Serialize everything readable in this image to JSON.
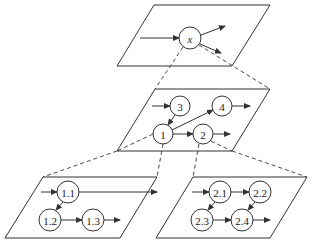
{
  "diagram": {
    "type": "hierarchical-graph-refinement",
    "colors": {
      "stroke": "#333333",
      "background": "#ffffff",
      "text": "#222222"
    },
    "planes": [
      {
        "id": "top",
        "corners": [
          [
            154,
            5
          ],
          [
            270,
            5
          ],
          [
            232,
            66
          ],
          [
            117,
            66
          ]
        ]
      },
      {
        "id": "middle",
        "corners": [
          [
            155,
            89
          ],
          [
            270,
            89
          ],
          [
            232,
            151
          ],
          [
            117,
            151
          ]
        ]
      },
      {
        "id": "bottom-left",
        "corners": [
          [
            43,
            177
          ],
          [
            157,
            177
          ],
          [
            120,
            238
          ],
          [
            5,
            238
          ]
        ]
      },
      {
        "id": "bottom-right",
        "corners": [
          [
            193,
            177
          ],
          [
            307,
            177
          ],
          [
            270,
            238
          ],
          [
            156,
            238
          ]
        ]
      }
    ],
    "nodes": [
      {
        "id": "x",
        "label": "x",
        "plane": "top",
        "cx": 190,
        "cy": 38,
        "r": 11,
        "italic": true
      },
      {
        "id": "n1",
        "label": "1",
        "plane": "middle",
        "cx": 163,
        "cy": 134,
        "r": 10
      },
      {
        "id": "n2",
        "label": "2",
        "plane": "middle",
        "cx": 203,
        "cy": 134,
        "r": 10
      },
      {
        "id": "n3",
        "label": "3",
        "plane": "middle",
        "cx": 180,
        "cy": 106,
        "r": 10
      },
      {
        "id": "n4",
        "label": "4",
        "plane": "middle",
        "cx": 222,
        "cy": 106,
        "r": 10
      },
      {
        "id": "n11",
        "label": "1.1",
        "plane": "bottom-left",
        "cx": 68,
        "cy": 192,
        "r": 11
      },
      {
        "id": "n12",
        "label": "1.2",
        "plane": "bottom-left",
        "cx": 50,
        "cy": 220,
        "r": 11
      },
      {
        "id": "n13",
        "label": "1.3",
        "plane": "bottom-left",
        "cx": 93,
        "cy": 220,
        "r": 11
      },
      {
        "id": "n21",
        "label": "2.1",
        "plane": "bottom-right",
        "cx": 220,
        "cy": 192,
        "r": 11
      },
      {
        "id": "n22",
        "label": "2.2",
        "plane": "bottom-right",
        "cx": 260,
        "cy": 192,
        "r": 11
      },
      {
        "id": "n23",
        "label": "2.3",
        "plane": "bottom-right",
        "cx": 202,
        "cy": 220,
        "r": 11
      },
      {
        "id": "n24",
        "label": "2.4",
        "plane": "bottom-right",
        "cx": 242,
        "cy": 220,
        "r": 11
      }
    ],
    "edges": [
      {
        "from": "in",
        "to": "x",
        "x1": 140,
        "y1": 38,
        "x2": 179,
        "y2": 38
      },
      {
        "from": "x",
        "to": "out",
        "x1": 201,
        "y1": 35,
        "x2": 225,
        "y2": 26
      },
      {
        "from": "x",
        "to": "out",
        "x1": 200,
        "y1": 44,
        "x2": 221,
        "y2": 53
      },
      {
        "from": "in",
        "to": "3",
        "x1": 152,
        "y1": 106,
        "x2": 170,
        "y2": 106
      },
      {
        "from": "3",
        "to": "1",
        "x1": 175,
        "y1": 115,
        "x2": 168,
        "y2": 125
      },
      {
        "from": "1",
        "to": "4",
        "x1": 172,
        "y1": 130,
        "x2": 213,
        "y2": 110
      },
      {
        "from": "4",
        "to": "out",
        "x1": 232,
        "y1": 106,
        "x2": 250,
        "y2": 106
      },
      {
        "from": "1",
        "to": "2",
        "x1": 173,
        "y1": 134,
        "x2": 193,
        "y2": 134
      },
      {
        "from": "2",
        "to": "out",
        "x1": 213,
        "y1": 134,
        "x2": 230,
        "y2": 134
      },
      {
        "from": "in",
        "to": "1.1",
        "x1": 41,
        "y1": 192,
        "x2": 57,
        "y2": 192
      },
      {
        "from": "1.1",
        "to": "out",
        "x1": 79,
        "y1": 192,
        "x2": 157,
        "y2": 192
      },
      {
        "from": "1.1",
        "to": "1.2",
        "x1": 63,
        "y1": 202,
        "x2": 56,
        "y2": 210
      },
      {
        "from": "1.2",
        "to": "1.3",
        "x1": 61,
        "y1": 220,
        "x2": 82,
        "y2": 220
      },
      {
        "from": "1.3",
        "to": "out",
        "x1": 104,
        "y1": 220,
        "x2": 120,
        "y2": 220
      },
      {
        "from": "in",
        "to": "2.1",
        "x1": 192,
        "y1": 192,
        "x2": 209,
        "y2": 192
      },
      {
        "from": "2.1",
        "to": "2.2",
        "x1": 231,
        "y1": 192,
        "x2": 249,
        "y2": 192
      },
      {
        "from": "2.1",
        "to": "2.3",
        "x1": 215,
        "y1": 202,
        "x2": 208,
        "y2": 210
      },
      {
        "from": "2.2",
        "to": "2.4",
        "x1": 255,
        "y1": 202,
        "x2": 248,
        "y2": 210
      },
      {
        "from": "2.3",
        "to": "2.4",
        "x1": 213,
        "y1": 220,
        "x2": 231,
        "y2": 220
      },
      {
        "from": "2.4",
        "to": "out",
        "x1": 253,
        "y1": 220,
        "x2": 270,
        "y2": 220
      }
    ],
    "refinement_links": [
      {
        "from_plane": "top",
        "to_plane": "middle",
        "x1": 183,
        "y1": 47,
        "x2": 155,
        "y2": 89
      },
      {
        "from_plane": "top",
        "to_plane": "middle",
        "x1": 199,
        "y1": 45,
        "x2": 270,
        "y2": 89
      },
      {
        "from_plane": "middle",
        "to_plane": "bottom-left",
        "x1": 153,
        "y1": 134,
        "x2": 117,
        "y2": 151
      },
      {
        "from_plane": "middle",
        "to_plane": "bottom-left",
        "x1": 117,
        "y1": 151,
        "x2": 43,
        "y2": 177
      },
      {
        "from_plane": "middle",
        "to_plane": "bottom-left",
        "x1": 163,
        "y1": 144,
        "x2": 157,
        "y2": 177
      },
      {
        "from_plane": "middle",
        "to_plane": "bottom-right",
        "x1": 199,
        "y1": 144,
        "x2": 193,
        "y2": 177
      },
      {
        "from_plane": "middle",
        "to_plane": "bottom-right",
        "x1": 211,
        "y1": 141,
        "x2": 232,
        "y2": 151
      },
      {
        "from_plane": "middle",
        "to_plane": "bottom-right",
        "x1": 232,
        "y1": 151,
        "x2": 307,
        "y2": 177
      }
    ]
  }
}
